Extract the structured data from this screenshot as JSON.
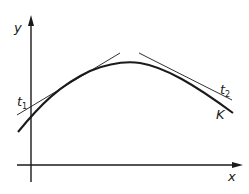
{
  "diagram": {
    "axes": {
      "x_label": "x",
      "y_label": "y"
    },
    "curve": {
      "label": "K"
    },
    "tangents": [
      {
        "label_main": "t",
        "label_sub": "1"
      },
      {
        "label_main": "t",
        "label_sub": "2"
      }
    ],
    "colors": {
      "stroke": "#1a1a1a",
      "background": "#ffffff"
    }
  }
}
